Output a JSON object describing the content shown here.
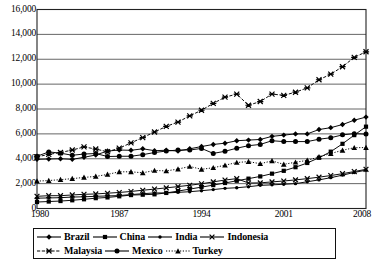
{
  "chart_data": {
    "type": "line",
    "title": "",
    "subtitle": "",
    "xlabel": "",
    "ylabel": "",
    "xlim": [
      1980,
      2008
    ],
    "ylim": [
      0,
      16000
    ],
    "grid": "horizontal",
    "legend_position": "bottom",
    "y_ticks": [
      "0",
      "2,000",
      "4,000",
      "6,000",
      "8,000",
      "10,000",
      "12,000",
      "14,000",
      "16,000"
    ],
    "y_tick_values": [
      0,
      2000,
      4000,
      6000,
      8000,
      10000,
      12000,
      14000,
      16000
    ],
    "x_ticks": [
      "1980",
      "1987",
      "1994",
      "2001",
      "2008"
    ],
    "x_tick_values": [
      1980,
      1987,
      1994,
      2001,
      2008
    ],
    "x": [
      1980,
      1981,
      1982,
      1983,
      1984,
      1985,
      1986,
      1987,
      1988,
      1989,
      1990,
      1991,
      1992,
      1993,
      1994,
      1995,
      1996,
      1997,
      1998,
      1999,
      2000,
      2001,
      2002,
      2003,
      2004,
      2005,
      2006,
      2007,
      2008
    ],
    "series": [
      {
        "name": "Brazil",
        "marker": "diamond",
        "line": "solid",
        "values": [
          3950,
          3980,
          4000,
          3950,
          4120,
          4300,
          4620,
          4700,
          4680,
          4800,
          4650,
          4680,
          4620,
          4800,
          4980,
          5150,
          5250,
          5450,
          5500,
          5550,
          5800,
          5900,
          6000,
          6000,
          6350,
          6500,
          6750,
          7100,
          7350
        ]
      },
      {
        "name": "China",
        "marker": "square",
        "line": "solid",
        "values": [
          520,
          560,
          600,
          660,
          740,
          830,
          890,
          980,
          1080,
          1110,
          1140,
          1250,
          1400,
          1560,
          1720,
          1880,
          2050,
          2230,
          2400,
          2580,
          2800,
          3030,
          3320,
          3660,
          4080,
          4570,
          5200,
          5900,
          6580
        ]
      },
      {
        "name": "India",
        "marker": "circle-small",
        "line": "solid",
        "values": [
          830,
          850,
          870,
          920,
          940,
          980,
          1010,
          1040,
          1120,
          1190,
          1250,
          1250,
          1300,
          1350,
          1430,
          1520,
          1620,
          1670,
          1750,
          1860,
          1900,
          1950,
          2000,
          2150,
          2300,
          2480,
          2680,
          2900,
          3080
        ]
      },
      {
        "name": "Indonesia",
        "marker": "cross",
        "line": "solid",
        "values": [
          980,
          1030,
          1030,
          1090,
          1140,
          1170,
          1230,
          1290,
          1370,
          1470,
          1560,
          1660,
          1760,
          1870,
          1990,
          2140,
          2290,
          2400,
          2050,
          2060,
          2140,
          2210,
          2300,
          2400,
          2520,
          2650,
          2800,
          2970,
          3150
        ]
      },
      {
        "name": "Malaysia",
        "marker": "star",
        "line": "dashed",
        "values": [
          4150,
          4350,
          4500,
          4700,
          4950,
          4780,
          4560,
          4850,
          5280,
          5700,
          6150,
          6600,
          6950,
          7450,
          7900,
          8450,
          8950,
          9200,
          8300,
          8600,
          9200,
          9100,
          9350,
          9700,
          10350,
          10800,
          11400,
          12150,
          12600
        ]
      },
      {
        "name": "Mexico",
        "marker": "circle-filled",
        "line": "solid",
        "values": [
          4200,
          4550,
          4450,
          4280,
          4380,
          4420,
          4180,
          4200,
          4200,
          4330,
          4500,
          4620,
          4700,
          4700,
          4830,
          4430,
          4600,
          4850,
          5050,
          5150,
          5450,
          5380,
          5380,
          5380,
          5570,
          5690,
          5920,
          6020,
          5980
        ]
      },
      {
        "name": "Turkey",
        "marker": "triangle",
        "line": "dotted",
        "values": [
          2200,
          2250,
          2320,
          2400,
          2500,
          2580,
          2740,
          2950,
          2950,
          2870,
          3060,
          3020,
          3170,
          3380,
          3150,
          3280,
          3480,
          3700,
          3770,
          3600,
          3830,
          3550,
          3720,
          3870,
          4150,
          4420,
          4680,
          4890,
          4900
        ]
      }
    ]
  },
  "legend": {
    "rows": [
      [
        {
          "label": "Brazil",
          "key": "brazil"
        },
        {
          "label": "China",
          "key": "china"
        },
        {
          "label": "India",
          "key": "india"
        },
        {
          "label": "Indonesia",
          "key": "indonesia"
        }
      ],
      [
        {
          "label": "Malaysia",
          "key": "malaysia"
        },
        {
          "label": "Mexico",
          "key": "mexico"
        },
        {
          "label": "Turkey",
          "key": "turkey"
        }
      ]
    ]
  },
  "style": {
    "line_color": "#000000",
    "grid_color": "#555555",
    "axis_color": "#222222",
    "background": "#ffffff"
  }
}
